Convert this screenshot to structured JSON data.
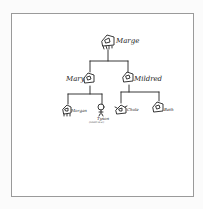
{
  "diagram": {
    "type": "family-tree",
    "style": "hand-drawn",
    "line_color": "#222222",
    "frame_color": "#9a9a9a",
    "nodes": [
      {
        "id": "marge",
        "name": "Marge",
        "icon": "house-icon",
        "generation": 0
      },
      {
        "id": "mary",
        "name": "Mary",
        "icon": "house-icon",
        "generation": 1,
        "parent": "marge"
      },
      {
        "id": "mildred",
        "name": "Mildred",
        "icon": "house-icon",
        "generation": 1,
        "parent": "marge"
      },
      {
        "id": "morgan",
        "name": "Morgan",
        "icon": "house-icon",
        "generation": 2,
        "parent": "mary"
      },
      {
        "id": "tyson",
        "name": "Tyson",
        "icon": "person-icon",
        "generation": 2,
        "parent": "mary",
        "note": "(small text)"
      },
      {
        "id": "chole",
        "name": "Chole",
        "icon": "house-icon",
        "generation": 2,
        "parent": "mildred"
      },
      {
        "id": "beth",
        "name": "Beth",
        "icon": "house-icon",
        "generation": 2,
        "parent": "mildred"
      }
    ]
  }
}
